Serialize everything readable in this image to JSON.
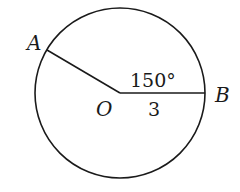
{
  "diagram": {
    "type": "circle-sector",
    "center": {
      "label": "O"
    },
    "points": [
      {
        "label": "A"
      },
      {
        "label": "B"
      }
    ],
    "angle_label": "150°",
    "radius_label": "3",
    "stroke_color": "#1a1a1a",
    "background": "#ffffff"
  }
}
